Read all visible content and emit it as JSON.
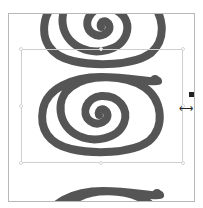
{
  "canvas": {
    "background": "#ffffff",
    "frame_border": "#b8b8b8",
    "selection_border": "#cfcfcf"
  },
  "image": {
    "subject": "spiral",
    "stroke_color": "#555555",
    "tiles": [
      "top-partial",
      "center-full",
      "bottom-partial"
    ]
  },
  "selection": {
    "handles": [
      "top-left",
      "top-center",
      "top-right",
      "middle-left",
      "middle-right",
      "bottom-left",
      "bottom-center",
      "bottom-right"
    ]
  },
  "cursor": {
    "type": "horizontal-resize",
    "glyph": "⟷"
  }
}
